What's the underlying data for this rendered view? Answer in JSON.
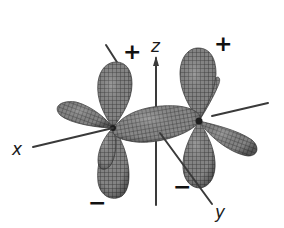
{
  "diagram": {
    "type": "atomic-orbital-lobes",
    "axes": {
      "x": {
        "label": "x"
      },
      "y": {
        "label": "y"
      },
      "z": {
        "label": "z"
      }
    },
    "phase_signs": {
      "left_upper": "+",
      "right_upper": "+",
      "left_lower": "−",
      "right_lower": "−"
    },
    "colors": {
      "lobe_fill": "#7a7a7a",
      "lobe_mesh": "#3c3c3c",
      "axis": "#3a3a3a",
      "background": "#ffffff"
    }
  }
}
